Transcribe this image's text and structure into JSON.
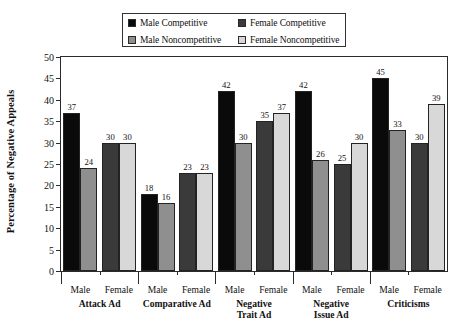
{
  "chart_data": {
    "type": "bar",
    "title": "",
    "xlabel": "",
    "ylabel": "Percentage of Negative Appeals",
    "ylim": [
      0,
      50
    ],
    "yticks": [
      0,
      5,
      10,
      15,
      20,
      25,
      30,
      35,
      40,
      45,
      50
    ],
    "grid": false,
    "legend_position": "top-center",
    "categories": [
      "Attack Ad",
      "Comparative Ad",
      "Negative Trait Ad",
      "Negative Issue Ad",
      "Criticisms"
    ],
    "subcategories": [
      "Male",
      "Female"
    ],
    "series": [
      {
        "name": "Male Competitive",
        "color": "#0a0a0a",
        "subgroup": "Male",
        "values": [
          37,
          18,
          42,
          42,
          45
        ]
      },
      {
        "name": "Male Noncompetitive",
        "color": "#8f8f8f",
        "subgroup": "Male",
        "values": [
          24,
          16,
          30,
          26,
          33
        ]
      },
      {
        "name": "Female Competitive",
        "color": "#3a3a3a",
        "subgroup": "Female",
        "values": [
          30,
          23,
          35,
          25,
          30
        ]
      },
      {
        "name": "Female Noncompetitive",
        "color": "#d8d8d8",
        "subgroup": "Female",
        "values": [
          30,
          23,
          37,
          30,
          39
        ]
      }
    ],
    "bar_groups": [
      {
        "category": "Attack Ad",
        "subgroups": [
          {
            "label": "Male",
            "bars": [
              {
                "series": "Male Competitive",
                "value": 37
              },
              {
                "series": "Male Noncompetitive",
                "value": 24
              }
            ]
          },
          {
            "label": "Female",
            "bars": [
              {
                "series": "Female Competitive",
                "value": 30
              },
              {
                "series": "Female Noncompetitive",
                "value": 30
              }
            ]
          }
        ]
      },
      {
        "category": "Comparative Ad",
        "subgroups": [
          {
            "label": "Male",
            "bars": [
              {
                "series": "Male Competitive",
                "value": 18
              },
              {
                "series": "Male Noncompetitive",
                "value": 16
              }
            ]
          },
          {
            "label": "Female",
            "bars": [
              {
                "series": "Female Competitive",
                "value": 23
              },
              {
                "series": "Female Noncompetitive",
                "value": 23
              }
            ]
          }
        ]
      },
      {
        "category": "Negative Trait Ad",
        "category_lines": [
          "Negative",
          "Trait Ad"
        ],
        "subgroups": [
          {
            "label": "Male",
            "bars": [
              {
                "series": "Male Competitive",
                "value": 42
              },
              {
                "series": "Male Noncompetitive",
                "value": 30
              }
            ]
          },
          {
            "label": "Female",
            "bars": [
              {
                "series": "Female Competitive",
                "value": 35
              },
              {
                "series": "Female Noncompetitive",
                "value": 37
              }
            ]
          }
        ]
      },
      {
        "category": "Negative Issue Ad",
        "category_lines": [
          "Negative",
          "Issue Ad"
        ],
        "subgroups": [
          {
            "label": "Male",
            "bars": [
              {
                "series": "Male Competitive",
                "value": 42
              },
              {
                "series": "Male Noncompetitive",
                "value": 26
              }
            ]
          },
          {
            "label": "Female",
            "bars": [
              {
                "series": "Female Competitive",
                "value": 25
              },
              {
                "series": "Female Noncompetitive",
                "value": 30
              }
            ]
          }
        ]
      },
      {
        "category": "Criticisms",
        "subgroups": [
          {
            "label": "Male",
            "bars": [
              {
                "series": "Male Competitive",
                "value": 45
              },
              {
                "series": "Male Noncompetitive",
                "value": 33
              }
            ]
          },
          {
            "label": "Female",
            "bars": [
              {
                "series": "Female Competitive",
                "value": 30
              },
              {
                "series": "Female Noncompetitive",
                "value": 39
              }
            ]
          }
        ]
      }
    ]
  },
  "legend": {
    "entries": [
      {
        "label": "Male Competitive",
        "color": "#0a0a0a"
      },
      {
        "label": "Female Competitive",
        "color": "#3a3a3a"
      },
      {
        "label": "Male Noncompetitive",
        "color": "#8f8f8f"
      },
      {
        "label": "Female Noncompetitive",
        "color": "#d8d8d8"
      }
    ]
  },
  "axes": {
    "y_title": "Percentage of Negative Appeals"
  }
}
